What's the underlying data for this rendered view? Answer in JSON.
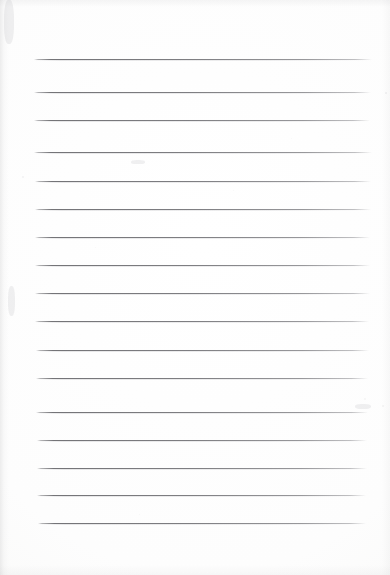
{
  "document": {
    "kind": "scanned-lined-paper",
    "title": "Blank ruled notebook page",
    "written_content": "",
    "page_background_color": "#fdfdfd",
    "rule_color": "#6e6e72",
    "rule_thickness_px": 1,
    "width_px": 390,
    "height_px": 575,
    "line_count": 17,
    "left_margin_x": 34,
    "right_margin_x": 372
  },
  "ruled_lines": [
    {
      "index": 1,
      "y": 59,
      "x1": 34,
      "x2": 372
    },
    {
      "index": 2,
      "y": 92,
      "x1": 34,
      "x2": 371
    },
    {
      "index": 3,
      "y": 120,
      "x1": 34,
      "x2": 370
    },
    {
      "index": 4,
      "y": 152,
      "x1": 34,
      "x2": 372
    },
    {
      "index": 5,
      "y": 181,
      "x1": 35,
      "x2": 371
    },
    {
      "index": 6,
      "y": 209,
      "x1": 35,
      "x2": 371
    },
    {
      "index": 7,
      "y": 237,
      "x1": 35,
      "x2": 370
    },
    {
      "index": 8,
      "y": 265,
      "x1": 35,
      "x2": 370
    },
    {
      "index": 9,
      "y": 293,
      "x1": 35,
      "x2": 370
    },
    {
      "index": 10,
      "y": 321,
      "x1": 35,
      "x2": 369
    },
    {
      "index": 11,
      "y": 350,
      "x1": 36,
      "x2": 369
    },
    {
      "index": 12,
      "y": 378,
      "x1": 36,
      "x2": 368
    },
    {
      "index": 13,
      "y": 412,
      "x1": 36,
      "x2": 368
    },
    {
      "index": 14,
      "y": 440,
      "x1": 37,
      "x2": 367
    },
    {
      "index": 15,
      "y": 468,
      "x1": 37,
      "x2": 367
    },
    {
      "index": 16,
      "y": 495,
      "x1": 37,
      "x2": 366
    },
    {
      "index": 17,
      "y": 523,
      "x1": 38,
      "x2": 366
    }
  ],
  "scan_marks": {
    "specks": [
      {
        "x": 385,
        "y": 92,
        "size": 2.2,
        "opacity": 0.34
      },
      {
        "x": 382,
        "y": 405,
        "size": 1.8,
        "opacity": 0.26
      },
      {
        "x": 22,
        "y": 176,
        "size": 1.6,
        "opacity": 0.22
      },
      {
        "x": 139,
        "y": 514,
        "size": 1.4,
        "opacity": 0.18
      },
      {
        "x": 291,
        "y": 138,
        "size": 1.3,
        "opacity": 0.16
      },
      {
        "x": 233,
        "y": 190,
        "size": 1.2,
        "opacity": 0.15
      },
      {
        "x": 95,
        "y": 247,
        "size": 1.2,
        "opacity": 0.14
      },
      {
        "x": 364,
        "y": 398,
        "size": 1.5,
        "opacity": 0.2
      }
    ],
    "smudges": [
      {
        "x": 4,
        "y": 0,
        "w": 10,
        "h": 44
      },
      {
        "x": 8,
        "y": 286,
        "w": 7,
        "h": 30
      },
      {
        "x": 355,
        "y": 404,
        "w": 16,
        "h": 5
      },
      {
        "x": 131,
        "y": 160,
        "w": 14,
        "h": 4
      }
    ]
  }
}
